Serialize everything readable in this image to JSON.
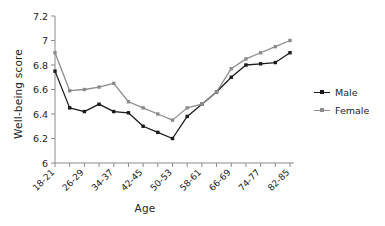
{
  "chart_data": {
    "type": "line",
    "title": "",
    "xlabel": "Age",
    "ylabel": "Well-being score",
    "ylim": [
      6,
      7.2
    ],
    "yticks": [
      "6",
      "6.2",
      "6.4",
      "6.6",
      "6.8",
      "7",
      "7.2"
    ],
    "ytick_values": [
      6,
      6.2,
      6.4,
      6.6,
      6.8,
      7,
      7.2
    ],
    "grid": false,
    "legend_position": "right",
    "x": [
      "18-21",
      "22-25",
      "26-29",
      "30-33",
      "34-37",
      "38-41",
      "42-45",
      "46-49",
      "50-53",
      "54-57",
      "58-61",
      "62-65",
      "66-69",
      "70-73",
      "74-77",
      "78-81",
      "82-85"
    ],
    "xtick_labels": [
      "18-21",
      "26-29",
      "34-37",
      "42-45",
      "50-53",
      "58-61",
      "66-69",
      "74-77",
      "82-85"
    ],
    "series": [
      {
        "name": "Male",
        "color": "#1a1a1a",
        "marker": "square",
        "values": [
          6.75,
          6.45,
          6.42,
          6.48,
          6.42,
          6.41,
          6.3,
          6.25,
          6.2,
          6.38,
          6.48,
          6.58,
          6.7,
          6.8,
          6.81,
          6.82,
          6.9
        ]
      },
      {
        "name": "Female",
        "color": "#8c8c8c",
        "marker": "square",
        "values": [
          6.9,
          6.59,
          6.6,
          6.62,
          6.65,
          6.5,
          6.45,
          6.4,
          6.35,
          6.45,
          6.48,
          6.58,
          6.77,
          6.85,
          6.9,
          6.95,
          7.0
        ]
      }
    ]
  },
  "legend": {
    "items": [
      {
        "label": "Male"
      },
      {
        "label": "Female"
      }
    ]
  },
  "axes": {
    "x_title": "Age",
    "y_title": "Well-being score"
  }
}
